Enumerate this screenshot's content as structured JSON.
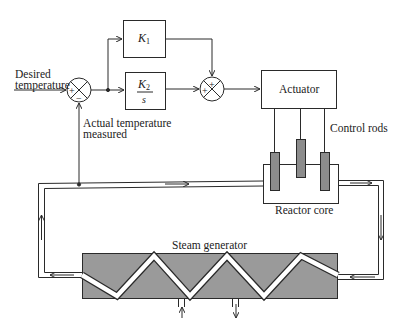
{
  "diagram": {
    "type": "feedback control block diagram with physical plant",
    "input_label_line1": "Desired",
    "input_label_line2": "temperature",
    "sum1": {
      "plus_sign": "+",
      "minus_sign": "−"
    },
    "sum2": {
      "plus_top": "+",
      "plus_left": "+"
    },
    "k1_block": {
      "gain": "K",
      "subscript": "1"
    },
    "k2_block": {
      "gain": "K",
      "subscript": "2",
      "denominator": "s"
    },
    "actuator_label": "Actuator",
    "control_rods_label": "Control rods",
    "reactor_core_label": "Reactor core",
    "feedback_label_line1": "Actual temperature",
    "feedback_label_line2": "measured",
    "steam_generator_label": "Steam generator",
    "colors": {
      "line": "#2a2a2a",
      "rod_fill": "#8c8c8c",
      "steam_generator_fill": "#9a9a9a",
      "background": "#ffffff"
    }
  }
}
